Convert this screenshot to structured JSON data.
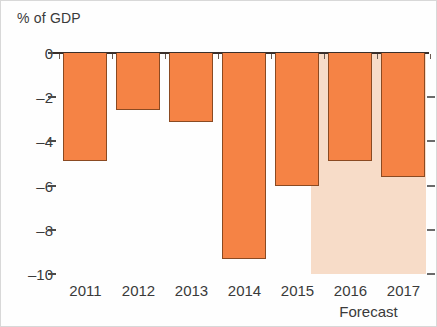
{
  "chart_data": {
    "type": "bar",
    "title": "",
    "ylabel": "% of GDP",
    "xlabel": "",
    "categories": [
      "2011",
      "2012",
      "2013",
      "2014",
      "2015",
      "2016",
      "2017"
    ],
    "values": [
      -4.9,
      -2.6,
      -3.1,
      -9.3,
      -6.0,
      -4.9,
      -5.6
    ],
    "ylim": [
      -10,
      0
    ],
    "ytick_labels": [
      "0",
      "–2",
      "–4",
      "–6",
      "–8",
      "–10"
    ],
    "ytick_values": [
      0,
      -2,
      -4,
      -6,
      -8,
      -10
    ],
    "grid": false,
    "legend": "none",
    "annotations": [
      {
        "text": "Forecast",
        "covers_categories": [
          "2016",
          "2017"
        ],
        "shaded": true
      }
    ],
    "colors": {
      "bar_fill": "#f58345",
      "bar_outline": "#8a4a22",
      "forecast_band": "#f7dcc8",
      "axis_line": "#3a2f2a",
      "text": "#3a3a3a",
      "background": "#ffffff"
    }
  },
  "axis_title": "% of GDP",
  "forecast_caption": "Forecast"
}
